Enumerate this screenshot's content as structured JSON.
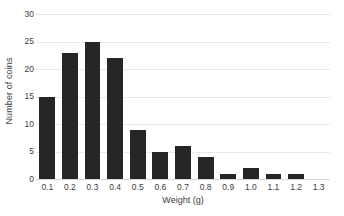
{
  "chart_data": {
    "type": "bar",
    "title": "",
    "xlabel": "Weight (g)",
    "ylabel": "Number of coins",
    "categories": [
      "0.1",
      "0.2",
      "0.3",
      "0.4",
      "0.5",
      "0.6",
      "0.7",
      "0.8",
      "0.9",
      "1.0",
      "1.1",
      "1.2",
      "1.3"
    ],
    "values": [
      15,
      23,
      25,
      22,
      9,
      5,
      6,
      4,
      1,
      2,
      1,
      1,
      0
    ],
    "ylim": [
      0,
      30
    ],
    "yticks": [
      0,
      5,
      10,
      15,
      20,
      25,
      30
    ],
    "ytick_labels": [
      "0",
      "5",
      "10",
      "15",
      "20",
      "25",
      "30"
    ],
    "grid": true,
    "grid_axis": "y",
    "legend": false,
    "bar_color": "#262626",
    "grid_color": "#e9e9e9",
    "background_color": "#ffffff",
    "text_color": "#3d3d3d"
  }
}
